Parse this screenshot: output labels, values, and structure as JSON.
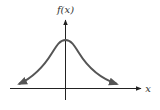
{
  "diagram": {
    "type": "bell-curve",
    "y_axis_label": "f(x)",
    "x_axis_label": "x",
    "colors": {
      "axis": "#222222",
      "curve": "#555555",
      "background": "#ffffff"
    }
  }
}
